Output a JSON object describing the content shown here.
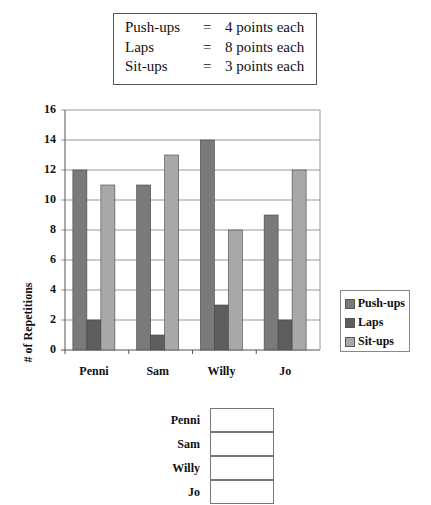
{
  "key": {
    "rows": [
      {
        "activity": "Push-ups",
        "eq": "=",
        "points": "4 points each"
      },
      {
        "activity": "Laps",
        "eq": "=",
        "points": "8 points each"
      },
      {
        "activity": "Sit-ups",
        "eq": "=",
        "points": "3 points each"
      }
    ]
  },
  "chart_data": {
    "type": "bar",
    "title": "",
    "xlabel": "",
    "ylabel": "# of Repetitions",
    "categories": [
      "Penni",
      "Sam",
      "Willy",
      "Jo"
    ],
    "series": [
      {
        "name": "Push-ups",
        "values": [
          12,
          11,
          14,
          9
        ],
        "color": "#7a7a7a"
      },
      {
        "name": "Laps",
        "values": [
          2,
          1,
          3,
          2
        ],
        "color": "#5e5e5e"
      },
      {
        "name": "Sit-ups",
        "values": [
          11,
          13,
          8,
          12
        ],
        "color": "#a8a8a8"
      }
    ],
    "ylim": [
      0,
      16
    ],
    "yticks": [
      0,
      2,
      4,
      6,
      8,
      10,
      12,
      14,
      16
    ],
    "grid": true,
    "legend_position": "right"
  },
  "score_table": {
    "rows": [
      {
        "name": "Penni",
        "value": ""
      },
      {
        "name": "Sam",
        "value": ""
      },
      {
        "name": "Willy",
        "value": ""
      },
      {
        "name": "Jo",
        "value": ""
      }
    ]
  }
}
